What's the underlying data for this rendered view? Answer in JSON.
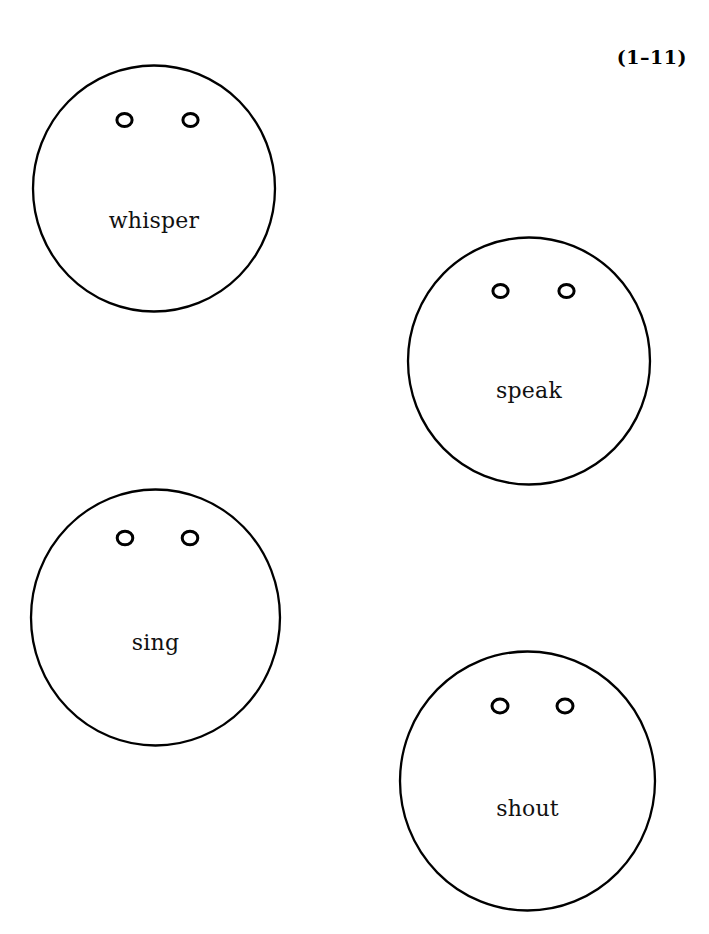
{
  "page": {
    "width": 709,
    "height": 934,
    "background_color": "#ffffff",
    "ink_color": "#000000"
  },
  "exercise": {
    "label": "(1–11)"
  },
  "faces": [
    {
      "id": "whisper",
      "label": "whisper",
      "eyes_icon": "eye-circle-outline",
      "eye_count": 2
    },
    {
      "id": "speak",
      "label": "speak",
      "eyes_icon": "eye-circle-outline",
      "eye_count": 2
    },
    {
      "id": "sing",
      "label": "sing",
      "eyes_icon": "eye-circle-outline",
      "eye_count": 2
    },
    {
      "id": "shout",
      "label": "shout",
      "eyes_icon": "eye-circle-outline",
      "eye_count": 2
    }
  ]
}
